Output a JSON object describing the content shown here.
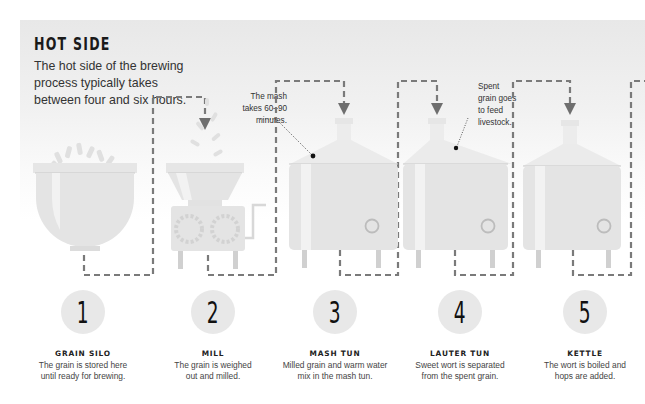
{
  "header": {
    "title": "HOT SIDE",
    "intro_lines": [
      "The hot side of the brewing",
      "process typically takes",
      "between four and six hours."
    ]
  },
  "annotations": {
    "mash": [
      "The mash",
      "takes 60–90",
      "minutes."
    ],
    "spent_grain": [
      "Spent",
      "grain goes",
      "to feed",
      "livestock."
    ]
  },
  "colors": {
    "panel_gray": "#e8e8e8",
    "vessel_fill": "#e4e4e4",
    "vessel_highlight": "#f2f2f2",
    "dashed_line": "#7a7a7a",
    "arrow": "#6e6e6e",
    "circle_fill": "#e8e8e8",
    "text_dark": "#1a1a1a"
  },
  "steps": [
    {
      "number": "1",
      "name": "GRAIN SILO",
      "desc_lines": [
        "The grain is stored here",
        "until ready for brewing."
      ],
      "icon": "grain-silo-icon"
    },
    {
      "number": "2",
      "name": "MILL",
      "desc_lines": [
        "The grain is weighed",
        "out and milled."
      ],
      "icon": "mill-icon"
    },
    {
      "number": "3",
      "name": "MASH TUN",
      "desc_lines": [
        "Milled grain and warm water",
        "mix in the mash tun."
      ],
      "icon": "mash-tun-icon"
    },
    {
      "number": "4",
      "name": "LAUTER TUN",
      "desc_lines": [
        "Sweet wort is separated",
        "from the spent grain."
      ],
      "icon": "lauter-tun-icon"
    },
    {
      "number": "5",
      "name": "KETTLE",
      "desc_lines": [
        "The wort is boiled and",
        "hops are added."
      ],
      "icon": "kettle-icon"
    }
  ]
}
